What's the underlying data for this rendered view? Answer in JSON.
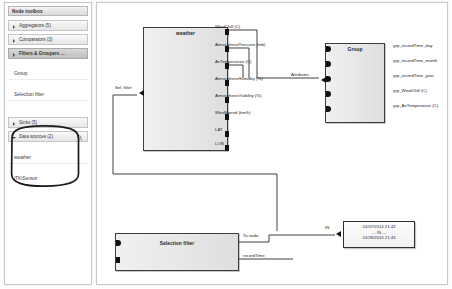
{
  "sidebar": {
    "header": "Node toolbox",
    "groups": [
      {
        "label": "Aggregators (5)",
        "state": "collapsed",
        "selected": false
      },
      {
        "label": "Comparators (3)",
        "state": "collapsed",
        "selected": false
      },
      {
        "label": "Filters & Groupers ...",
        "state": "collapsed",
        "selected": true
      },
      {
        "label": "Sinks (5)",
        "state": "collapsed",
        "selected": false
      },
      {
        "label": "Data sources (2)",
        "state": "open",
        "selected": false
      }
    ],
    "filter_items": [
      {
        "label": "Group"
      },
      {
        "label": "Selection filter"
      }
    ],
    "datasource_items": [
      {
        "label": "weather"
      },
      {
        "label": "iTKiSensor"
      }
    ],
    "search_icon": "magnifier-icon"
  },
  "canvas": {
    "nodes": [
      {
        "id": "weather",
        "title": "weather",
        "inputs": [
          {
            "label": "Sel. filter"
          }
        ],
        "outputs": [
          {
            "label": "WindChill (C)"
          },
          {
            "label": "AtmospherePressure (mb)"
          },
          {
            "label": "AirTemperature (C)"
          },
          {
            "label": "AtmosphereHumidity (%)"
          },
          {
            "label": "AtmosphereVisibility (%)"
          },
          {
            "label": "WindSpeed (km/h)"
          },
          {
            "label": "LAT"
          },
          {
            "label": "LON"
          }
        ]
      },
      {
        "id": "group",
        "title": "Group",
        "inputs": [
          {
            "label": "Attributes"
          }
        ],
        "outputs": [
          {
            "label": "grp_recordTime_day"
          },
          {
            "label": "grp_recordTime_month"
          },
          {
            "label": "grp_recordTime_year"
          },
          {
            "label": "grp_WindChill (C)"
          },
          {
            "label": "grp_AirTemperature (C)"
          }
        ]
      },
      {
        "id": "selection-filter",
        "title": "Selection filter",
        "inputs": [],
        "outputs": [
          {
            "label": "To node"
          },
          {
            "label": "recordTime"
          }
        ]
      }
    ],
    "range_box": {
      "port_label": "IN",
      "from": "01/07/2014 21:43",
      "separator": "--- IN ---",
      "to": "01/28/2014 21:43"
    }
  },
  "colors": {
    "accent": "#c2c2c2",
    "node_border": "#3d3d3d",
    "port": "#111111",
    "panel_border": "#c8c8c8"
  }
}
